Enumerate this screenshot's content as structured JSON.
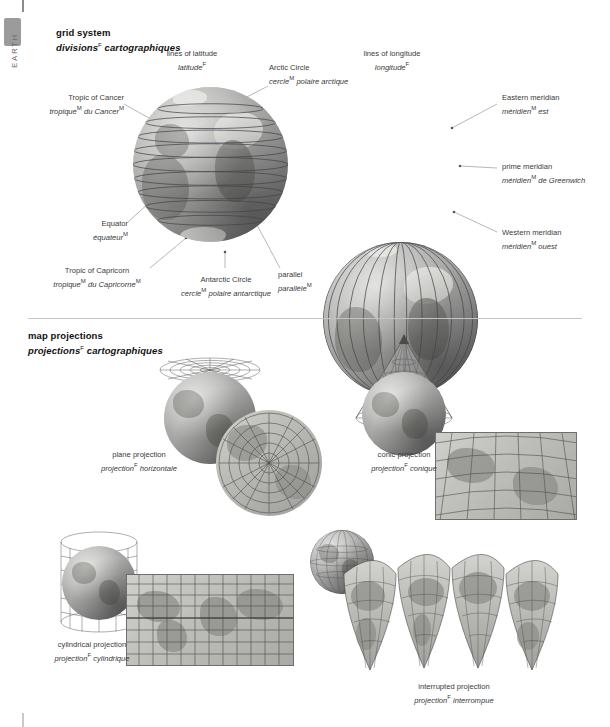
{
  "rail": {
    "chapter": "EARTH"
  },
  "sections": [
    {
      "id": "grid-system",
      "title_en": "grid system",
      "title_fr": "divisions",
      "title_fr_sup": "F",
      "title_fr_rest": "cartographiques"
    },
    {
      "id": "map-projections",
      "title_en": "map projections",
      "title_fr": "projections",
      "title_fr_sup": "F",
      "title_fr_rest": "cartographiques"
    }
  ],
  "grid_system": {
    "globe_latitude": {
      "heading_en": "lines of latitude",
      "heading_fr": "latitude",
      "heading_fr_sup": "F"
    },
    "globe_longitude": {
      "heading_en": "lines of longitude",
      "heading_fr": "longitude",
      "heading_fr_sup": "F"
    },
    "labels": [
      {
        "name": "arctic-circle",
        "en": "Arctic Circle",
        "fr": "cercle",
        "fr_sup": "M",
        "fr_rest": "polaire arctique"
      },
      {
        "name": "tropic-of-cancer",
        "en": "Tropic of Cancer",
        "fr": "tropique",
        "fr_sup": "M",
        "fr_rest": "du Cancer",
        "fr_rest_sup": "M"
      },
      {
        "name": "equator",
        "en": "Equator",
        "fr": "équateur",
        "fr_sup": "M"
      },
      {
        "name": "tropic-of-capricorn",
        "en": "Tropic of Capricorn",
        "fr": "tropique",
        "fr_sup": "M",
        "fr_rest": "du Capricorne",
        "fr_rest_sup": "M"
      },
      {
        "name": "antarctic-circle",
        "en": "Antarctic Circle",
        "fr": "cercle",
        "fr_sup": "M",
        "fr_rest": "polaire antarctique"
      },
      {
        "name": "parallel",
        "en": "parallel",
        "fr": "parallèle",
        "fr_sup": "M"
      },
      {
        "name": "eastern-meridian",
        "en": "Eastern meridian",
        "fr": "méridien",
        "fr_sup": "M",
        "fr_rest": "est"
      },
      {
        "name": "prime-meridian",
        "en": "prime meridian",
        "fr": "méridien",
        "fr_sup": "M",
        "fr_rest": "de Greenwich"
      },
      {
        "name": "western-meridian",
        "en": "Western meridian",
        "fr": "méridien",
        "fr_sup": "M",
        "fr_rest": "ouest"
      }
    ]
  },
  "map_projections": {
    "items": [
      {
        "name": "plane-projection",
        "en": "plane projection",
        "fr": "projection",
        "fr_sup": "F",
        "fr_rest": "horizontale"
      },
      {
        "name": "conic-projection",
        "en": "conic projection",
        "fr": "projection",
        "fr_sup": "F",
        "fr_rest": "conique"
      },
      {
        "name": "cylindrical-projection",
        "en": "cylindrical projection",
        "fr": "projection",
        "fr_sup": "F",
        "fr_rest": "cylindrique"
      },
      {
        "name": "interrupted-projection",
        "en": "interrupted projection",
        "fr": "projection",
        "fr_sup": "F",
        "fr_rest": "interrompue"
      }
    ]
  },
  "colors": {
    "page_background": "#ffffff",
    "text": "#3a3a3a",
    "heading": "#111111",
    "rail_tab": "#9b9b9b",
    "rail_label": "#6d6d6d",
    "divider": "#c3c3c3",
    "leader_line": "#9a9a9a",
    "globe_mid": "#9a9a99",
    "globe_dark": "#4c4c4e",
    "map_fill": "#bdbdb9",
    "grid_line": "#5a5a5a"
  }
}
